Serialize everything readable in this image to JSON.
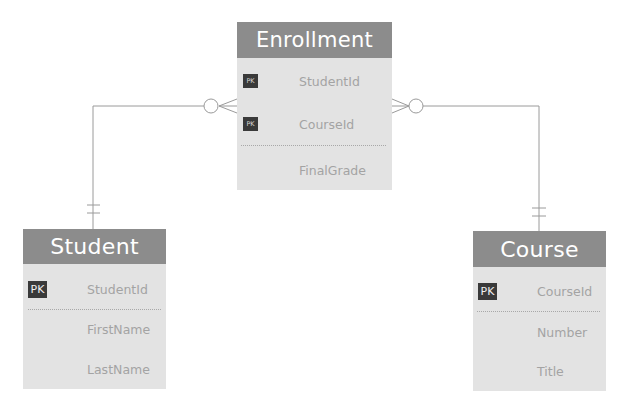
{
  "diagram": {
    "type": "entity-relationship",
    "entities": [
      {
        "id": "enrollment",
        "title": "Enrollment",
        "fields": [
          {
            "name": "StudentId",
            "pk": true,
            "badge": "PK"
          },
          {
            "name": "CourseId",
            "pk": true,
            "badge": "PK"
          },
          {
            "name": "FinalGrade",
            "pk": false
          }
        ]
      },
      {
        "id": "student",
        "title": "Student",
        "fields": [
          {
            "name": "StudentId",
            "pk": true,
            "badge": "PK"
          },
          {
            "name": "FirstName",
            "pk": false
          },
          {
            "name": "LastName",
            "pk": false
          }
        ]
      },
      {
        "id": "course",
        "title": "Course",
        "fields": [
          {
            "name": "CourseId",
            "pk": true,
            "badge": "PK"
          },
          {
            "name": "Number",
            "pk": false
          },
          {
            "name": "Title",
            "pk": false
          }
        ]
      }
    ],
    "relationships": [
      {
        "from": "student",
        "to": "enrollment",
        "from_cardinality": "one-and-only-one",
        "to_cardinality": "zero-or-many"
      },
      {
        "from": "course",
        "to": "enrollment",
        "from_cardinality": "one-and-only-one",
        "to_cardinality": "zero-or-many"
      }
    ],
    "colors": {
      "header_bg": "#8c8c8c",
      "body_bg": "#e3e3e3",
      "field_text": "#a3a3a3",
      "pk_badge_bg": "#3a3a3a",
      "connector": "#9a9a9a"
    }
  }
}
